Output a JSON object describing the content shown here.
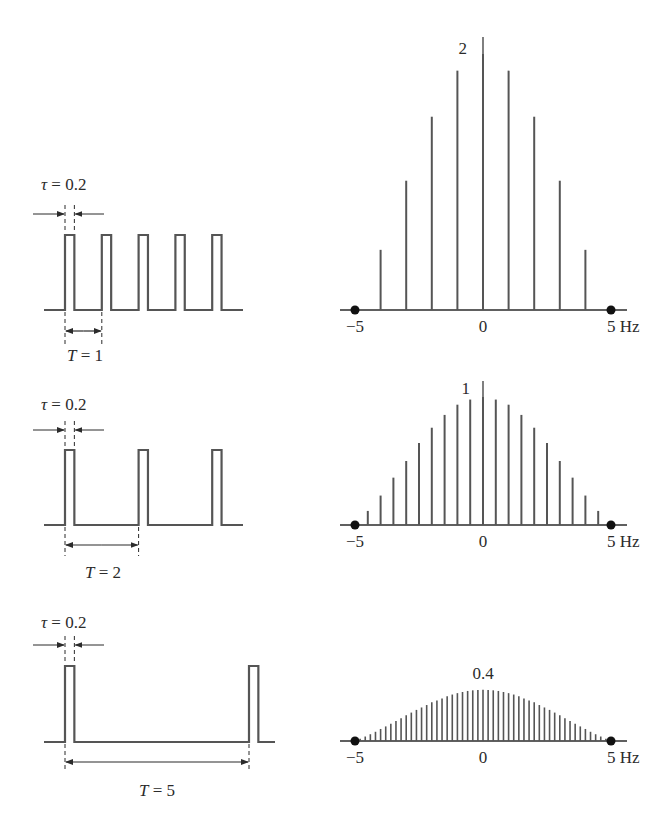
{
  "figure": {
    "panels": [
      {
        "tau_label": "τ = 0.2",
        "period_label": "T = 1",
        "peak_label": "2",
        "axis_ticks": [
          "−5",
          "0",
          "5 Hz"
        ]
      },
      {
        "tau_label": "τ = 0.2",
        "period_label": "T = 2",
        "peak_label": "1",
        "axis_ticks": [
          "−5",
          "0",
          "5 Hz"
        ]
      },
      {
        "tau_label": "τ = 0.2",
        "period_label": "T = 5",
        "peak_label": "0.4",
        "axis_ticks": [
          "−5",
          "0",
          "5 Hz"
        ]
      }
    ],
    "colors": {
      "line": "#555555",
      "text": "#2b2b2b",
      "dot": "#111111"
    }
  },
  "chart_data": [
    {
      "type": "line",
      "title": "Rectangular pulse train, tau = 0.2, T = 1",
      "xlabel": "t",
      "ylabel": "",
      "tau": 0.2,
      "T": 1,
      "pulse_starts": [
        0,
        1,
        2,
        3,
        4
      ]
    },
    {
      "type": "bar",
      "title": "Line spectrum, T = 1",
      "xlabel": "Hz",
      "ylabel": "",
      "xlim": [
        -5,
        5
      ],
      "ylim": [
        0,
        2
      ],
      "x": [
        -4,
        -3,
        -2,
        -1,
        0,
        1,
        2,
        3,
        4
      ],
      "values": [
        0.47,
        1.01,
        1.51,
        1.87,
        2.0,
        1.87,
        1.51,
        1.01,
        0.47
      ],
      "tick_labels": [
        "−5",
        "0",
        "5 Hz"
      ],
      "annotations": [
        "2"
      ]
    },
    {
      "type": "line",
      "title": "Rectangular pulse train, tau = 0.2, T = 2",
      "xlabel": "t",
      "ylabel": "",
      "tau": 0.2,
      "T": 2,
      "pulse_starts": [
        0,
        2,
        4
      ]
    },
    {
      "type": "bar",
      "title": "Line spectrum, T = 2",
      "xlabel": "Hz",
      "ylabel": "",
      "xlim": [
        -5,
        5
      ],
      "ylim": [
        0,
        1
      ],
      "x": [
        -4.5,
        -4,
        -3.5,
        -3,
        -2.5,
        -2,
        -1.5,
        -1,
        -0.5,
        0,
        0.5,
        1,
        1.5,
        2,
        2.5,
        3,
        3.5,
        4,
        4.5
      ],
      "values": [
        0.11,
        0.23,
        0.37,
        0.5,
        0.64,
        0.76,
        0.86,
        0.94,
        0.98,
        1.0,
        0.98,
        0.94,
        0.86,
        0.76,
        0.64,
        0.5,
        0.37,
        0.23,
        0.11
      ],
      "tick_labels": [
        "−5",
        "0",
        "5 Hz"
      ],
      "annotations": [
        "1"
      ]
    },
    {
      "type": "line",
      "title": "Rectangular pulse train, tau = 0.2, T = 5",
      "xlabel": "t",
      "ylabel": "",
      "tau": 0.2,
      "T": 5,
      "pulse_starts": [
        0,
        5
      ]
    },
    {
      "type": "bar",
      "title": "Line spectrum, T = 5",
      "xlabel": "Hz",
      "ylabel": "",
      "xlim": [
        -5,
        5
      ],
      "ylim": [
        0,
        0.4
      ],
      "x": [
        -4.8,
        -4.6,
        -4.4,
        -4.2,
        -4.0,
        -3.8,
        -3.6,
        -3.4,
        -3.2,
        -3.0,
        -2.8,
        -2.6,
        -2.4,
        -2.2,
        -2.0,
        -1.8,
        -1.6,
        -1.4,
        -1.2,
        -1.0,
        -0.8,
        -0.6,
        -0.4,
        -0.2,
        0,
        0.2,
        0.4,
        0.6,
        0.8,
        1.0,
        1.2,
        1.4,
        1.6,
        1.8,
        2.0,
        2.2,
        2.4,
        2.6,
        2.8,
        3.0,
        3.2,
        3.4,
        3.6,
        3.8,
        4.0,
        4.2,
        4.4,
        4.6,
        4.8
      ],
      "values": [
        0.017,
        0.035,
        0.053,
        0.072,
        0.094,
        0.114,
        0.135,
        0.157,
        0.178,
        0.202,
        0.222,
        0.243,
        0.262,
        0.281,
        0.303,
        0.317,
        0.333,
        0.35,
        0.363,
        0.374,
        0.383,
        0.391,
        0.396,
        0.399,
        0.4,
        0.399,
        0.396,
        0.391,
        0.383,
        0.374,
        0.363,
        0.35,
        0.333,
        0.317,
        0.303,
        0.281,
        0.262,
        0.243,
        0.222,
        0.202,
        0.178,
        0.157,
        0.135,
        0.114,
        0.094,
        0.072,
        0.053,
        0.035,
        0.017
      ],
      "tick_labels": [
        "−5",
        "0",
        "5 Hz"
      ],
      "annotations": [
        "0.4"
      ]
    }
  ]
}
